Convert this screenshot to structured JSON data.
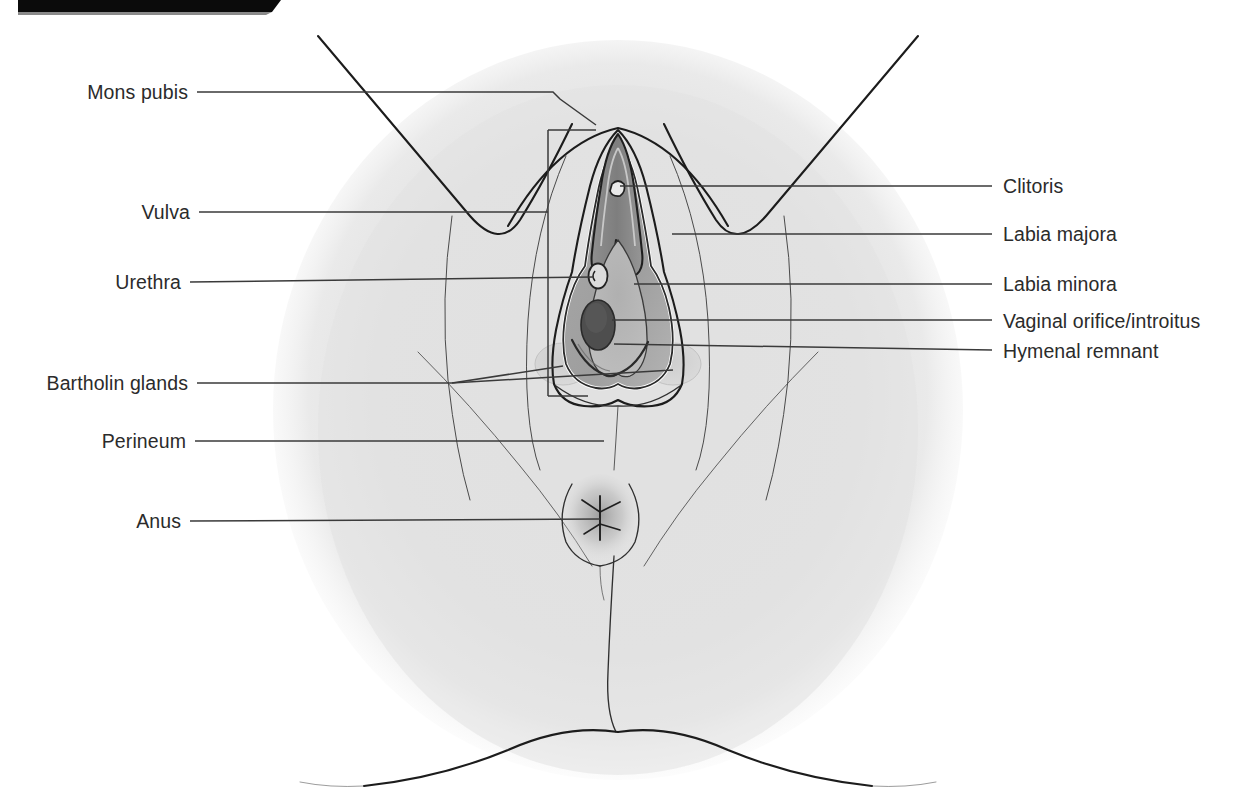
{
  "figure": {
    "top_bar_present": true,
    "background_color": "#ffffff",
    "body_fill_color": "#e2e2e2",
    "outline_color": "#1c1c1c",
    "label_text_color": "#2b2b2b",
    "leader_line_color": "#3a3a3a"
  },
  "labels_left": [
    {
      "id": "mons-pubis",
      "text": "Mons pubis"
    },
    {
      "id": "vulva",
      "text": "Vulva"
    },
    {
      "id": "urethra",
      "text": "Urethra"
    },
    {
      "id": "bartholin-glands",
      "text": "Bartholin glands"
    },
    {
      "id": "perineum",
      "text": "Perineum"
    },
    {
      "id": "anus",
      "text": "Anus"
    }
  ],
  "labels_right": [
    {
      "id": "clitoris",
      "text": "Clitoris"
    },
    {
      "id": "labia-majora",
      "text": "Labia majora"
    },
    {
      "id": "labia-minora",
      "text": "Labia minora"
    },
    {
      "id": "vaginal-orifice",
      "text": "Vaginal orifice/introitus"
    },
    {
      "id": "hymenal-remnant",
      "text": "Hymenal remnant"
    }
  ],
  "structures": [
    {
      "id": "mons-pubis",
      "name": "Mons pubis"
    },
    {
      "id": "labia-majora",
      "name": "Labia majora"
    },
    {
      "id": "labia-minora",
      "name": "Labia minora"
    },
    {
      "id": "clitoris",
      "name": "Clitoris"
    },
    {
      "id": "clitoral-hood",
      "name": "Clitoral hood"
    },
    {
      "id": "urethral-meatus",
      "name": "Urethral orifice"
    },
    {
      "id": "vaginal-orifice",
      "name": "Vaginal orifice / introitus"
    },
    {
      "id": "hymenal-remnant",
      "name": "Hymenal remnant"
    },
    {
      "id": "bartholin-gland-left",
      "name": "Left Bartholin gland"
    },
    {
      "id": "bartholin-gland-right",
      "name": "Right Bartholin gland"
    },
    {
      "id": "perineum",
      "name": "Perineum"
    },
    {
      "id": "anus",
      "name": "Anus"
    },
    {
      "id": "thigh-left",
      "name": "Left thigh"
    },
    {
      "id": "thigh-right",
      "name": "Right thigh"
    },
    {
      "id": "buttock-left",
      "name": "Left buttock"
    },
    {
      "id": "buttock-right",
      "name": "Right buttock"
    }
  ]
}
